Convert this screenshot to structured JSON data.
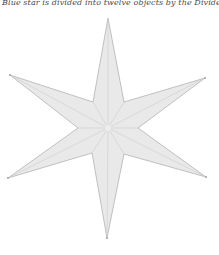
{
  "caption": {
    "text": "Blue star is divided into twelve objects by the Divide p"
  },
  "figure": {
    "kind": "six-pointed-star",
    "background": "#ffffff",
    "fill": "#e9e9e9",
    "outline_color": "#b3b3b3",
    "outline_width": 0.8,
    "facet_line_color": "#cccccc",
    "facet_line_width": 0.6,
    "center": [
      108,
      128
    ],
    "center_halo_color": "#ededed",
    "center_halo_radius": 3,
    "points": [
      [
        108,
        18
      ],
      [
        124,
        102
      ],
      [
        205,
        78
      ],
      [
        138,
        128
      ],
      [
        206,
        177
      ],
      [
        124,
        154
      ],
      [
        107,
        238
      ],
      [
        92,
        153
      ],
      [
        8,
        178
      ],
      [
        78,
        128
      ],
      [
        10,
        75
      ],
      [
        93,
        102
      ]
    ],
    "tip_nodes": [
      [
        205,
        78
      ],
      [
        206,
        177
      ],
      [
        107,
        238
      ],
      [
        8,
        178
      ],
      [
        10,
        75
      ]
    ],
    "tip_node_color": "#a8a8a8",
    "tip_node_radius": 1.1
  }
}
